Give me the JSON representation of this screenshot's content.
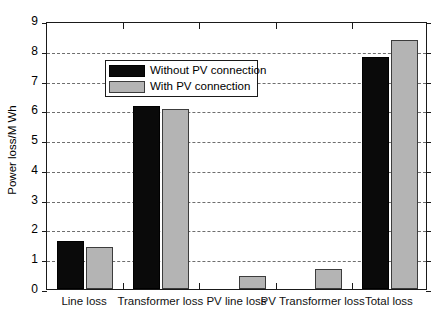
{
  "chart_data": {
    "type": "bar",
    "title": "",
    "xlabel": "",
    "ylabel": "Power loss/M Wh",
    "ylim": [
      0,
      9
    ],
    "yticks": [
      0,
      1,
      2,
      3,
      4,
      5,
      6,
      7,
      8,
      9
    ],
    "ytick_labels": [
      "0",
      "1",
      "2",
      "3",
      "4",
      "5",
      "6",
      "7",
      "8",
      "9"
    ],
    "grid": true,
    "grid_axis": "y",
    "grid_style": "dashed",
    "legend_position": "upper left",
    "categories": [
      "Line loss",
      "Transformer loss",
      "PV line loss",
      "PV Transformer loss",
      "Total loss"
    ],
    "series": [
      {
        "name": "Without PV connection",
        "color": "#0a0a0a",
        "values": [
          1.6,
          6.13,
          0.0,
          0.0,
          7.78
        ]
      },
      {
        "name": "With PV connection",
        "color": "#b4b4b4",
        "values": [
          1.4,
          6.05,
          0.45,
          0.66,
          8.37
        ]
      }
    ]
  },
  "axis": {
    "y_title": "Power loss/M Wh"
  },
  "legend": {
    "entries": [
      {
        "label": "Without PV connection",
        "swatch": "dark"
      },
      {
        "label": "With PV connection",
        "swatch": "light"
      }
    ]
  }
}
